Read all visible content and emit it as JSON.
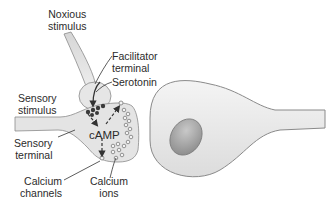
{
  "diagram": {
    "title": "",
    "colors": {
      "membrane_fill": "#e8e8e8",
      "membrane_stroke": "#8a8a8a",
      "nucleus": "#9a9a9a",
      "vesicle_dark": "#3a3a3a",
      "arrow": "#333333"
    },
    "labels": {
      "noxious_stimulus_1": "Noxious",
      "noxious_stimulus_2": "stimulus",
      "facilitator_terminal_1": "Facilitator",
      "facilitator_terminal_2": "terminal",
      "serotonin": "Serotonin",
      "sensory_stimulus_1": "Sensory",
      "sensory_stimulus_2": "stimulus",
      "camp": "cAMP",
      "sensory_terminal_1": "Sensory",
      "sensory_terminal_2": "terminal",
      "calcium_channels_1": "Calcium",
      "calcium_channels_2": "channels",
      "calcium_ions_1": "Calcium",
      "calcium_ions_2": "ions"
    },
    "nodes": [
      {
        "id": "facilitator-terminal",
        "label": "Facilitator terminal"
      },
      {
        "id": "sensory-terminal",
        "label": "Sensory terminal"
      },
      {
        "id": "postsynaptic-neuron",
        "label": ""
      }
    ],
    "edges": [
      {
        "from": "noxious-stimulus",
        "to": "facilitator-terminal"
      },
      {
        "from": "facilitator-terminal",
        "to": "serotonin"
      },
      {
        "from": "serotonin",
        "to": "camp"
      },
      {
        "from": "camp",
        "to": "calcium-channels"
      }
    ]
  }
}
